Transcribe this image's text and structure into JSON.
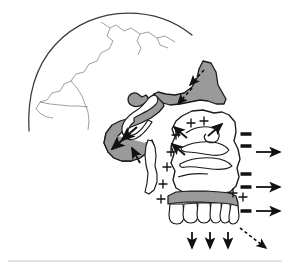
{
  "figure": {
    "background_color": "#ffffff",
    "width": 292,
    "height": 275
  },
  "palette": {
    "bone_outline": "#1a1a1a",
    "bone_fill": "#ffffff",
    "shaded_bone_fill": "#9a9a9a",
    "shaded_bone_outline": "#1a1a1a",
    "suture_line": "#8d8d93",
    "cranium_outline": "#3b3b3f",
    "arrow_solid": "#111111",
    "arrow_dashed": "#111111",
    "plus_sign": "#111111",
    "minus_sign": "#111111",
    "footer_rule": "#d9d9d9"
  },
  "structures": [
    {
      "id": "cranial-vault",
      "label": "Cranial vault",
      "shaded": false
    },
    {
      "id": "cranial-sutures",
      "label": "Cranial sutures",
      "shaded": false
    },
    {
      "id": "sphenoid-pterygoid-wedge",
      "label": "Sphenoid / pterygoid region",
      "shaded": true
    },
    {
      "id": "nasal-bone-frontal-process",
      "label": "Nasal bone and frontal process",
      "shaded": true
    },
    {
      "id": "orbital-rim",
      "label": "Orbital rim",
      "shaded": false
    },
    {
      "id": "maxilla-body",
      "label": "Maxilla body",
      "shaded": false
    },
    {
      "id": "nasal-conchae",
      "label": "Nasal conchae / turbinates",
      "shaded": false
    },
    {
      "id": "hard-palate",
      "label": "Hard palate",
      "shaded": true
    },
    {
      "id": "maxillary-dentition",
      "label": "Maxillary dentition",
      "shaded": false
    },
    {
      "id": "pterygoid-plate",
      "label": "Pterygoid plate",
      "shaded": false
    }
  ],
  "annotations": {
    "plus_signs": {
      "name": "apposition-markers",
      "glyph": "+",
      "meaning": "Bone apposition (deposition)",
      "count": 9,
      "positions": [
        {
          "x": 191,
          "y": 123
        },
        {
          "x": 204,
          "y": 121
        },
        {
          "x": 176,
          "y": 135
        },
        {
          "x": 171,
          "y": 152
        },
        {
          "x": 167,
          "y": 167
        },
        {
          "x": 163,
          "y": 184
        },
        {
          "x": 161,
          "y": 199
        },
        {
          "x": 243,
          "y": 197
        },
        {
          "x": 233,
          "y": 193
        }
      ]
    },
    "minus_signs": {
      "name": "resorption-markers",
      "glyph": "−",
      "meaning": "Bone resorption",
      "count": 5,
      "positions": [
        {
          "x": 246,
          "y": 134
        },
        {
          "x": 246,
          "y": 146
        },
        {
          "x": 246,
          "y": 174
        },
        {
          "x": 246,
          "y": 187
        },
        {
          "x": 246,
          "y": 211
        }
      ]
    },
    "solid_arrows": {
      "name": "growth-direction-arrows",
      "meaning": "Direction of displacement / growth",
      "count": 10,
      "items": [
        {
          "id": "arrow-right-upper",
          "x1": 256,
          "y1": 152,
          "x2": 280,
          "y2": 152,
          "direction": "right"
        },
        {
          "id": "arrow-right-middle",
          "x1": 256,
          "y1": 187,
          "x2": 280,
          "y2": 187,
          "direction": "right"
        },
        {
          "id": "arrow-right-lower",
          "x1": 256,
          "y1": 211,
          "x2": 280,
          "y2": 211,
          "direction": "right"
        },
        {
          "id": "arrow-down-first",
          "x1": 192,
          "y1": 232,
          "x2": 192,
          "y2": 248,
          "direction": "down"
        },
        {
          "id": "arrow-down-second",
          "x1": 210,
          "y1": 232,
          "x2": 210,
          "y2": 248,
          "direction": "down"
        },
        {
          "id": "arrow-down-third",
          "x1": 228,
          "y1": 232,
          "x2": 228,
          "y2": 248,
          "direction": "down"
        },
        {
          "id": "arrow-into-maxilla-upper",
          "x1": 187,
          "y1": 138,
          "x2": 174,
          "y2": 127,
          "direction": "up-left"
        },
        {
          "id": "arrow-into-maxilla-lower",
          "x1": 185,
          "y1": 155,
          "x2": 172,
          "y2": 144,
          "direction": "up-left"
        },
        {
          "id": "arrow-zygoma-up-right",
          "x1": 208,
          "y1": 136,
          "x2": 222,
          "y2": 124,
          "direction": "up-right"
        },
        {
          "id": "arrow-pterygoid-up",
          "x1": 140,
          "y1": 163,
          "x2": 132,
          "y2": 148,
          "direction": "up-left"
        }
      ]
    },
    "shaded_region_arrows": {
      "name": "shaded-region-arrows",
      "count": 2,
      "items": [
        {
          "id": "arrow-wedge-down-left-upper",
          "x1": 137,
          "y1": 127,
          "x2": 122,
          "y2": 140,
          "direction": "down-left"
        },
        {
          "id": "arrow-wedge-down-left-lower",
          "x1": 127,
          "y1": 136,
          "x2": 112,
          "y2": 149,
          "direction": "down-left"
        }
      ]
    },
    "dashed_arrows": {
      "name": "displacement-vector-arrows",
      "meaning": "Overall displacement vectors",
      "count": 3,
      "items": [
        {
          "id": "dashed-arrow-nasal-upper",
          "x1": 204,
          "y1": 70,
          "x2": 190,
          "y2": 85,
          "direction": "down-left"
        },
        {
          "id": "dashed-arrow-nasal-lower",
          "x1": 192,
          "y1": 88,
          "x2": 178,
          "y2": 104,
          "direction": "down-left"
        },
        {
          "id": "dashed-arrow-lower-right",
          "x1": 240,
          "y1": 228,
          "x2": 266,
          "y2": 248,
          "direction": "down-right"
        }
      ]
    }
  },
  "footer": {
    "rule_visible": true,
    "rule_x_start": 8,
    "rule_x_end": 282,
    "rule_y": 261
  }
}
